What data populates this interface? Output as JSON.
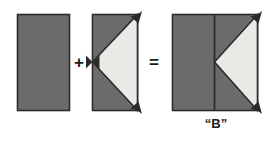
{
  "figure": {
    "background_color": "#ffffff",
    "operators": {
      "plus": "+",
      "equals": "="
    },
    "caption": {
      "result_label": "“B”"
    },
    "colors": {
      "fill_gray": "#6b6b6b",
      "fill_light": "#e9e9e6",
      "stroke_dark": "#2b2b2b",
      "text": "#1a1a1a"
    },
    "shapes": [
      {
        "name": "operand-one-rectangle",
        "role": "first operand",
        "description": "solid gray rectangle",
        "x": 17,
        "y": 14,
        "width": 53,
        "height": 97,
        "fill": "#6b6b6b",
        "stroke": "#2b2b2b"
      },
      {
        "name": "operand-two-rectangle-with-triangle",
        "role": "second operand",
        "description": "gray rectangle with light left-pointing triangle notch",
        "x": 92,
        "y": 14,
        "width": 46,
        "height": 97,
        "fill": "#6b6b6b",
        "triangle_fill": "#e9e9e6",
        "stroke": "#2b2b2b",
        "triangle_apex_x": 92,
        "triangle_apex_y": 62
      },
      {
        "name": "result-b-shape",
        "role": "result",
        "description": "combined square with light left-pointing triangle, reads as letter B",
        "x": 172,
        "y": 14,
        "width": 86,
        "height": 97,
        "fill": "#6b6b6b",
        "triangle_fill": "#e9e9e6",
        "stroke": "#2b2b2b",
        "divider_x": 214,
        "triangle_apex_x": 214,
        "triangle_apex_y": 62
      }
    ],
    "arrow_markers": [
      {
        "name": "arrow-marker-operand-two-top-right",
        "x": 138,
        "y": 14
      },
      {
        "name": "arrow-marker-operand-two-bottom-right",
        "x": 138,
        "y": 111
      },
      {
        "name": "arrow-marker-operand-two-apex",
        "x": 92,
        "y": 62
      },
      {
        "name": "arrow-marker-result-top-right",
        "x": 258,
        "y": 14
      },
      {
        "name": "arrow-marker-result-bottom-right",
        "x": 258,
        "y": 111
      }
    ]
  }
}
